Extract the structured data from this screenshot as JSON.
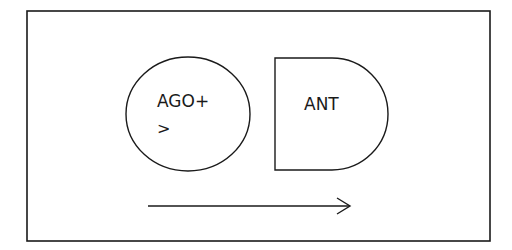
{
  "diagram": {
    "frame": {
      "stroke": "#1a1a1a"
    },
    "agonist": {
      "line1": "AGO+",
      "line2": ">"
    },
    "antagonist": {
      "label": "ANT"
    },
    "arrow": {
      "direction": "right",
      "stroke": "#1a1a1a"
    }
  }
}
